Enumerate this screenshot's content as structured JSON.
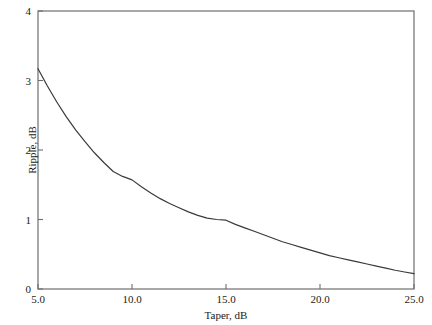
{
  "chart_data": {
    "type": "line",
    "title": "",
    "xlabel": "Taper, dB",
    "ylabel": "Ripple, dB",
    "xlim": [
      5.0,
      25.0
    ],
    "ylim": [
      0,
      4
    ],
    "grid": false,
    "legend": null,
    "xticks": [
      "5.0",
      "10.0",
      "15.0",
      "20.0",
      "25.0"
    ],
    "xtick_values": [
      5.0,
      10.0,
      15.0,
      20.0,
      25.0
    ],
    "yticks": [
      "0",
      "1",
      "2",
      "3",
      "4"
    ],
    "ytick_values": [
      0,
      1,
      2,
      3,
      4
    ],
    "series": [
      {
        "name": "Ripple vs Taper",
        "color": "#3a3a3a",
        "x": [
          5.0,
          5.5,
          6.0,
          6.5,
          7.0,
          7.5,
          8.0,
          8.5,
          9.0,
          9.5,
          10.0,
          10.5,
          11.0,
          11.5,
          12.0,
          12.5,
          13.0,
          13.5,
          14.0,
          14.5,
          15.0,
          15.5,
          16.0,
          16.5,
          17.0,
          17.5,
          18.0,
          18.5,
          19.0,
          19.5,
          20.0,
          20.5,
          21.0,
          21.5,
          22.0,
          22.5,
          23.0,
          23.5,
          24.0,
          24.5,
          25.0
        ],
        "y": [
          3.17,
          2.92,
          2.69,
          2.48,
          2.29,
          2.12,
          1.96,
          1.82,
          1.69,
          1.62,
          1.57,
          1.47,
          1.38,
          1.3,
          1.23,
          1.17,
          1.11,
          1.06,
          1.02,
          1.0,
          0.99,
          0.93,
          0.88,
          0.83,
          0.78,
          0.73,
          0.68,
          0.64,
          0.6,
          0.56,
          0.52,
          0.48,
          0.45,
          0.42,
          0.39,
          0.36,
          0.33,
          0.3,
          0.27,
          0.245,
          0.22
        ]
      }
    ]
  },
  "axes": {
    "frame_color": "#6e6e6e",
    "tick_color": "#6e6e6e",
    "line_color": "#3a3a3a"
  }
}
